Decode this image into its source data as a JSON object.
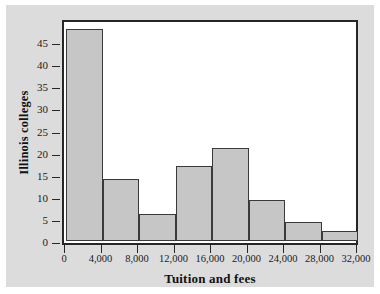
{
  "chart_data": {
    "type": "bar",
    "title": "",
    "subtitle": "",
    "xlabel": "Tuition and fees",
    "ylabel": "Illinois colleges",
    "categories": [
      "0-4,000",
      "4,000-8,000",
      "8,000-12,000",
      "12,000-16,000",
      "16,000-20,000",
      "20,000-24,000",
      "24,000-28,000",
      "28,000-32,000"
    ],
    "bin_edges": [
      0,
      4000,
      8000,
      12000,
      16000,
      20000,
      24000,
      28000,
      32000
    ],
    "values": [
      48,
      14,
      6,
      17,
      21,
      9.3,
      4.2,
      2.3
    ],
    "xlim": [
      0,
      32000
    ],
    "ylim": [
      0,
      50
    ],
    "xticks": [
      0,
      4000,
      8000,
      12000,
      16000,
      20000,
      24000,
      28000,
      32000
    ],
    "xtick_labels": [
      "0",
      "4,000",
      "8,000",
      "12,000",
      "16,000",
      "20,000",
      "24,000",
      "28,000",
      "32,000"
    ],
    "yticks": [
      0,
      5,
      10,
      15,
      20,
      25,
      30,
      35,
      40,
      45
    ],
    "ytick_labels": [
      "0",
      "5",
      "10",
      "15",
      "20",
      "25",
      "30",
      "35",
      "40",
      "45"
    ],
    "grid": false,
    "legend": null,
    "bar_fill_color": "#c6c6c6",
    "bar_edge_color": "#3a3a3a",
    "frame_color": "#262626",
    "plot_background": "#ffffff",
    "page_background": "#dcdcdc"
  }
}
